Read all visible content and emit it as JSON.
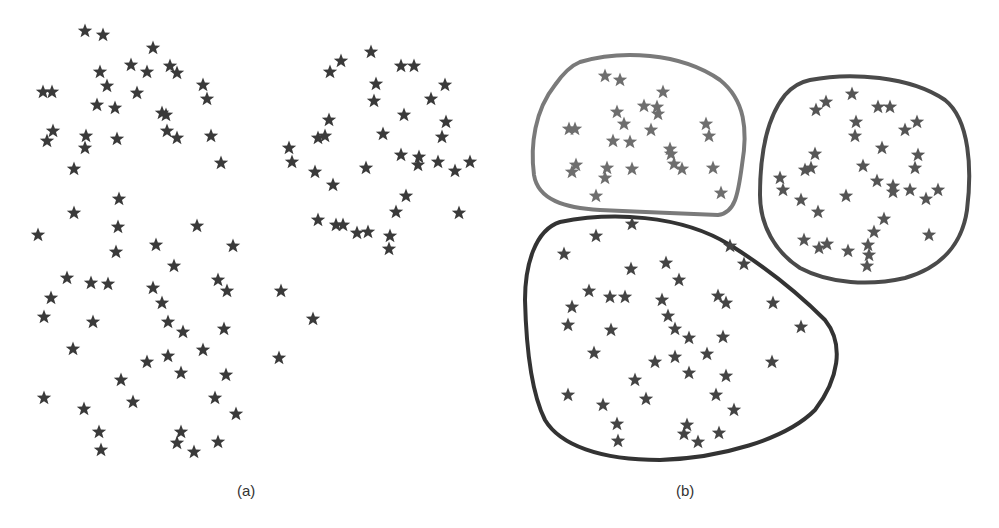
{
  "figure": {
    "panels": [
      {
        "id": "a",
        "caption": "(a)",
        "description": "Unlabeled scatter of star-shaped data points",
        "star_color": "#3a3a3a",
        "points": [
          [
            85,
            31
          ],
          [
            103,
            35
          ],
          [
            153,
            48
          ],
          [
            131,
            65
          ],
          [
            100,
            72
          ],
          [
            147,
            72
          ],
          [
            170,
            66
          ],
          [
            177,
            73
          ],
          [
            203,
            85
          ],
          [
            207,
            99
          ],
          [
            43,
            92
          ],
          [
            52,
            92
          ],
          [
            107,
            86
          ],
          [
            97,
            105
          ],
          [
            115,
            108
          ],
          [
            137,
            93
          ],
          [
            162,
            113
          ],
          [
            166,
            115
          ],
          [
            167,
            131
          ],
          [
            177,
            138
          ],
          [
            211,
            136
          ],
          [
            53,
            131
          ],
          [
            47,
            141
          ],
          [
            86,
            136
          ],
          [
            85,
            148
          ],
          [
            117,
            139
          ],
          [
            74,
            169
          ],
          [
            221,
            163
          ],
          [
            119,
            199
          ],
          [
            330,
            72
          ],
          [
            341,
            61
          ],
          [
            371,
            52
          ],
          [
            401,
            66
          ],
          [
            414,
            66
          ],
          [
            376,
            84
          ],
          [
            374,
            101
          ],
          [
            431,
            99
          ],
          [
            445,
            85
          ],
          [
            404,
            115
          ],
          [
            329,
            120
          ],
          [
            318,
            138
          ],
          [
            325,
            136
          ],
          [
            383,
            134
          ],
          [
            446,
            122
          ],
          [
            442,
            137
          ],
          [
            289,
            148
          ],
          [
            292,
            162
          ],
          [
            315,
            172
          ],
          [
            366,
            168
          ],
          [
            401,
            155
          ],
          [
            419,
            157
          ],
          [
            418,
            165
          ],
          [
            438,
            162
          ],
          [
            455,
            171
          ],
          [
            470,
            162
          ],
          [
            333,
            185
          ],
          [
            406,
            196
          ],
          [
            396,
            212
          ],
          [
            459,
            213
          ],
          [
            318,
            220
          ],
          [
            336,
            225
          ],
          [
            343,
            225
          ],
          [
            357,
            233
          ],
          [
            368,
            232
          ],
          [
            390,
            236
          ],
          [
            389,
            249
          ],
          [
            74,
            213
          ],
          [
            38,
            235
          ],
          [
            118,
            227
          ],
          [
            197,
            226
          ],
          [
            116,
            252
          ],
          [
            156,
            245
          ],
          [
            233,
            246
          ],
          [
            174,
            266
          ],
          [
            67,
            278
          ],
          [
            91,
            283
          ],
          [
            108,
            284
          ],
          [
            51,
            298
          ],
          [
            44,
            317
          ],
          [
            153,
            288
          ],
          [
            162,
            303
          ],
          [
            218,
            280
          ],
          [
            227,
            291
          ],
          [
            281,
            291
          ],
          [
            93,
            322
          ],
          [
            168,
            322
          ],
          [
            183,
            332
          ],
          [
            224,
            329
          ],
          [
            313,
            319
          ],
          [
            73,
            349
          ],
          [
            147,
            362
          ],
          [
            168,
            356
          ],
          [
            203,
            350
          ],
          [
            181,
            373
          ],
          [
            226,
            375
          ],
          [
            279,
            358
          ],
          [
            121,
            380
          ],
          [
            44,
            398
          ],
          [
            84,
            409
          ],
          [
            133,
            402
          ],
          [
            215,
            398
          ],
          [
            236,
            414
          ],
          [
            99,
            432
          ],
          [
            101,
            450
          ],
          [
            181,
            432
          ],
          [
            177,
            443
          ],
          [
            194,
            452
          ],
          [
            218,
            442
          ]
        ]
      },
      {
        "id": "b",
        "caption": "(b)",
        "description": "Same points grouped into three clusters with outlines",
        "clusters": [
          {
            "name": "cluster-top-left",
            "outline_color": "#7a7a7a",
            "star_color": "#6e6e6e",
            "outline_path": "M 580 62 C 620 50, 680 52, 720 80 C 745 100, 748 130, 742 165 C 738 195, 735 213, 718 215 C 690 214, 640 212, 600 210 C 565 208, 538 200, 534 175 C 530 145, 535 110, 555 85 C 562 75, 570 66, 580 62 Z",
            "points": [
              [
                605,
                76
              ],
              [
                620,
                80
              ],
              [
                663,
                92
              ],
              [
                617,
                112
              ],
              [
                644,
                106
              ],
              [
                657,
                107
              ],
              [
                658,
                114
              ],
              [
                624,
                124
              ],
              [
                651,
                130
              ],
              [
                569,
                129
              ],
              [
                575,
                129
              ],
              [
                613,
                141
              ],
              [
                630,
                142
              ],
              [
                670,
                149
              ],
              [
                671,
                154
              ],
              [
                706,
                124
              ],
              [
                709,
                136
              ],
              [
                576,
                165
              ],
              [
                572,
                172
              ],
              [
                607,
                168
              ],
              [
                605,
                178
              ],
              [
                632,
                169
              ],
              [
                674,
                164
              ],
              [
                682,
                169
              ],
              [
                713,
                168
              ],
              [
                721,
                193
              ],
              [
                596,
                196
              ]
            ]
          },
          {
            "name": "cluster-right",
            "outline_color": "#4a4a4a",
            "star_color": "#555555",
            "outline_path": "M 810 80 C 850 72, 910 76, 945 100 C 970 120, 972 170, 967 210 C 962 245, 940 268, 905 278 C 870 286, 830 284, 800 268 C 775 252, 760 225, 760 195 C 760 160, 765 120, 785 95 C 792 87, 800 82, 810 80 Z",
            "points": [
              [
                816,
                110
              ],
              [
                826,
                102
              ],
              [
                852,
                94
              ],
              [
                878,
                107
              ],
              [
                890,
                107
              ],
              [
                856,
                122
              ],
              [
                855,
                136
              ],
              [
                905,
                130
              ],
              [
                917,
                122
              ],
              [
                882,
                148
              ],
              [
                815,
                154
              ],
              [
                805,
                170
              ],
              [
                811,
                168
              ],
              [
                863,
                166
              ],
              [
                918,
                155
              ],
              [
                915,
                168
              ],
              [
                780,
                178
              ],
              [
                783,
                190
              ],
              [
                801,
                200
              ],
              [
                846,
                196
              ],
              [
                877,
                181
              ],
              [
                893,
                186
              ],
              [
                893,
                192
              ],
              [
                910,
                190
              ],
              [
                926,
                199
              ],
              [
                938,
                190
              ],
              [
                818,
                212
              ],
              [
                884,
                219
              ],
              [
                874,
                232
              ],
              [
                929,
                235
              ],
              [
                804,
                240
              ],
              [
                819,
                248
              ],
              [
                827,
                244
              ],
              [
                848,
                251
              ],
              [
                868,
                245
              ],
              [
                869,
                255
              ],
              [
                867,
                266
              ]
            ]
          },
          {
            "name": "cluster-bottom",
            "outline_color": "#333333",
            "star_color": "#444444",
            "outline_path": "M 560 222 C 610 212, 680 214, 730 245 C 770 270, 800 295, 825 320 C 845 345, 838 380, 815 410 C 785 440, 720 458, 660 460 C 600 460, 560 445, 545 420 C 530 390, 526 340, 525 300 C 525 265, 535 230, 560 222 Z",
            "points": [
              [
                632,
                224
              ],
              [
                596,
                236
              ],
              [
                564,
                254
              ],
              [
                631,
                269
              ],
              [
                666,
                263
              ],
              [
                730,
                246
              ],
              [
                679,
                280
              ],
              [
                744,
                264
              ],
              [
                589,
                291
              ],
              [
                610,
                297
              ],
              [
                625,
                297
              ],
              [
                572,
                307
              ],
              [
                568,
                325
              ],
              [
                662,
                300
              ],
              [
                668,
                316
              ],
              [
                718,
                296
              ],
              [
                726,
                303
              ],
              [
                773,
                303
              ],
              [
                611,
                330
              ],
              [
                675,
                329
              ],
              [
                689,
                338
              ],
              [
                723,
                337
              ],
              [
                801,
                327
              ],
              [
                594,
                353
              ],
              [
                655,
                362
              ],
              [
                675,
                357
              ],
              [
                707,
                354
              ],
              [
                689,
                373
              ],
              [
                726,
                376
              ],
              [
                772,
                362
              ],
              [
                635,
                380
              ],
              [
                568,
                395
              ],
              [
                603,
                405
              ],
              [
                646,
                399
              ],
              [
                716,
                395
              ],
              [
                734,
                410
              ],
              [
                617,
                424
              ],
              [
                618,
                441
              ],
              [
                687,
                425
              ],
              [
                684,
                434
              ],
              [
                698,
                442
              ],
              [
                719,
                433
              ]
            ]
          }
        ]
      }
    ]
  }
}
